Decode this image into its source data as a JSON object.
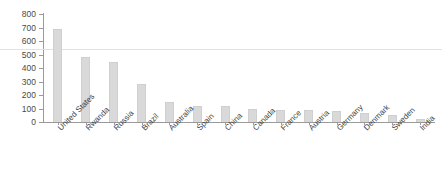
{
  "chart_data": {
    "type": "bar",
    "title": "",
    "subtitle": "",
    "xlabel": "",
    "ylabel": "",
    "ylim": [
      0,
      800
    ],
    "ytick_step": 100,
    "yticks": [
      "0",
      "100",
      "200",
      "300",
      "400",
      "500",
      "600",
      "700",
      "800"
    ],
    "grid": false,
    "legend": false,
    "reference_line": 540,
    "bar_color": "#d9d9d9",
    "axis_color": "#9a9a9a",
    "categories": [
      "United States",
      "Rwanda",
      "Russia",
      "Brazil",
      "Australia",
      "Spain",
      "China",
      "Canada",
      "France",
      "Austria",
      "Germany",
      "Denmark",
      "Sweden",
      "India"
    ],
    "values": [
      690,
      480,
      445,
      285,
      150,
      122,
      115,
      100,
      92,
      88,
      82,
      70,
      50,
      20
    ]
  }
}
